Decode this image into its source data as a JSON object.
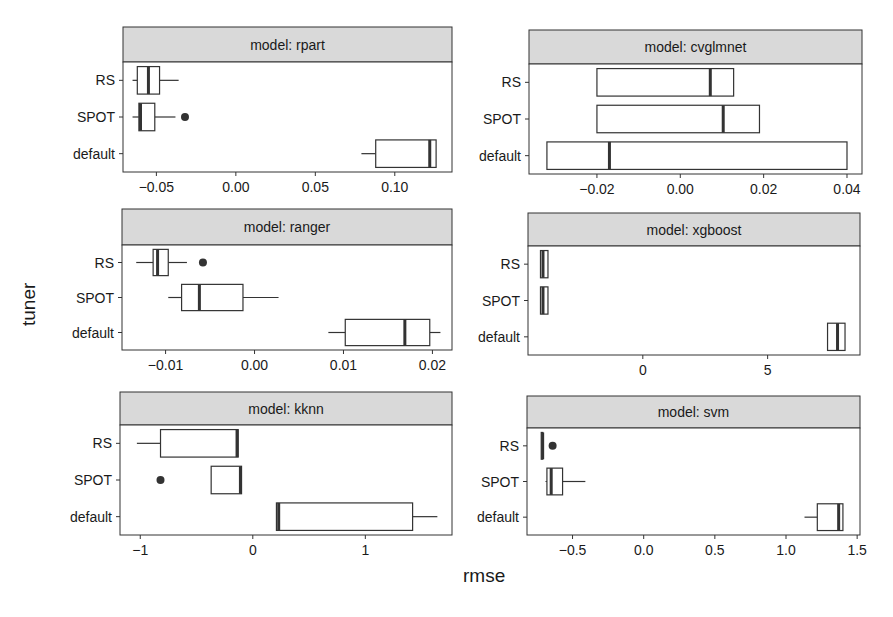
{
  "chart_data": {
    "type": "boxplot",
    "orientation": "horizontal",
    "facet_prefix": "model: ",
    "xlabel": "rmse",
    "ylabel": "tuner",
    "categories": [
      "RS",
      "SPOT",
      "default"
    ],
    "colors": {
      "box_fill": "#ffffff",
      "box_stroke": "#333333",
      "strip_fill": "#d9d9d9",
      "outlier": "#333333"
    },
    "panels": [
      {
        "name": "rpart",
        "title": "model: rpart",
        "ticks": [
          -0.05,
          0.0,
          0.05,
          0.1
        ],
        "tick_labels": [
          "-0.05",
          "0.00",
          "0.05",
          "0.10"
        ],
        "xlim": [
          -0.071,
          0.136
        ],
        "series": [
          {
            "tuner": "RS",
            "whisker_low": -0.065,
            "q1": -0.062,
            "median": -0.055,
            "q3": -0.048,
            "whisker_high": -0.036,
            "outliers": []
          },
          {
            "tuner": "SPOT",
            "whisker_low": -0.065,
            "q1": -0.061,
            "median": -0.06,
            "q3": -0.051,
            "whisker_high": -0.038,
            "outliers": [
              -0.032
            ]
          },
          {
            "tuner": "default",
            "whisker_low": 0.079,
            "q1": 0.088,
            "median": 0.122,
            "q3": 0.126,
            "whisker_high": 0.126,
            "outliers": []
          }
        ]
      },
      {
        "name": "cvglmnet",
        "title": "model: cvglmnet",
        "ticks": [
          -0.02,
          0.0,
          0.02,
          0.04
        ],
        "tick_labels": [
          "-0.02",
          "0.00",
          "0.02",
          "0.04"
        ],
        "xlim": [
          -0.0363,
          0.0436
        ],
        "series": [
          {
            "tuner": "RS",
            "whisker_low": -0.02,
            "q1": -0.02,
            "median": 0.0072,
            "q3": 0.0128,
            "whisker_high": 0.0128,
            "outliers": []
          },
          {
            "tuner": "SPOT",
            "whisker_low": -0.02,
            "q1": -0.02,
            "median": 0.0103,
            "q3": 0.019,
            "whisker_high": 0.019,
            "outliers": []
          },
          {
            "tuner": "default",
            "whisker_low": -0.032,
            "q1": -0.032,
            "median": -0.017,
            "q3": 0.04,
            "whisker_high": 0.04,
            "outliers": []
          }
        ]
      },
      {
        "name": "ranger",
        "title": "model: ranger",
        "ticks": [
          -0.01,
          0.0,
          0.01,
          0.02
        ],
        "tick_labels": [
          "-0.01",
          "0.00",
          "0.01",
          "0.02"
        ],
        "xlim": [
          -0.0149,
          0.0222
        ],
        "series": [
          {
            "tuner": "RS",
            "whisker_low": -0.0133,
            "q1": -0.0114,
            "median": -0.0109,
            "q3": -0.0097,
            "whisker_high": -0.0076,
            "outliers": [
              -0.0058
            ]
          },
          {
            "tuner": "SPOT",
            "whisker_low": -0.0097,
            "q1": -0.0082,
            "median": -0.0062,
            "q3": -0.0013,
            "whisker_high": 0.0027,
            "outliers": []
          },
          {
            "tuner": "default",
            "whisker_low": 0.0083,
            "q1": 0.0102,
            "median": 0.0169,
            "q3": 0.0197,
            "whisker_high": 0.0209,
            "outliers": []
          }
        ]
      },
      {
        "name": "xgboost",
        "title": "model: xgboost",
        "ticks": [
          0,
          5
        ],
        "tick_labels": [
          "0",
          "5"
        ],
        "xlim": [
          -4.6,
          8.7
        ],
        "series": [
          {
            "tuner": "RS",
            "whisker_low": -4.1,
            "q1": -4.1,
            "median": -4.0,
            "q3": -3.8,
            "whisker_high": -3.8,
            "outliers": []
          },
          {
            "tuner": "SPOT",
            "whisker_low": -4.1,
            "q1": -4.1,
            "median": -4.0,
            "q3": -3.8,
            "whisker_high": -3.8,
            "outliers": []
          },
          {
            "tuner": "default",
            "whisker_low": 7.4,
            "q1": 7.4,
            "median": 7.8,
            "q3": 8.1,
            "whisker_high": 8.1,
            "outliers": []
          }
        ]
      },
      {
        "name": "kknn",
        "title": "model: kknn",
        "ticks": [
          -1,
          0,
          1
        ],
        "tick_labels": [
          "-1",
          "0",
          "1"
        ],
        "xlim": [
          -1.18,
          1.77
        ],
        "series": [
          {
            "tuner": "RS",
            "whisker_low": -1.03,
            "q1": -0.82,
            "median": -0.14,
            "q3": -0.13,
            "whisker_high": -0.13,
            "outliers": []
          },
          {
            "tuner": "SPOT",
            "whisker_low": -0.37,
            "q1": -0.37,
            "median": -0.11,
            "q3": -0.1,
            "whisker_high": -0.1,
            "outliers": [
              -0.82
            ]
          },
          {
            "tuner": "default",
            "whisker_low": 0.21,
            "q1": 0.21,
            "median": 0.23,
            "q3": 1.42,
            "whisker_high": 1.64,
            "outliers": []
          }
        ]
      },
      {
        "name": "svm",
        "title": "model: svm",
        "ticks": [
          -0.5,
          0.0,
          0.5,
          1.0,
          1.5
        ],
        "tick_labels": [
          "-0.5",
          "0.0",
          "0.5",
          "1.0",
          "1.5"
        ],
        "xlim": [
          -0.82,
          1.52
        ],
        "series": [
          {
            "tuner": "RS",
            "whisker_low": -0.72,
            "q1": -0.72,
            "median": -0.71,
            "q3": -0.71,
            "whisker_high": -0.71,
            "outliers": [
              -0.64
            ]
          },
          {
            "tuner": "SPOT",
            "whisker_low": -0.69,
            "q1": -0.68,
            "median": -0.65,
            "q3": -0.57,
            "whisker_high": -0.41,
            "outliers": []
          },
          {
            "tuner": "default",
            "whisker_low": 1.13,
            "q1": 1.22,
            "median": 1.37,
            "q3": 1.4,
            "whisker_high": 1.4,
            "outliers": []
          }
        ]
      }
    ]
  }
}
